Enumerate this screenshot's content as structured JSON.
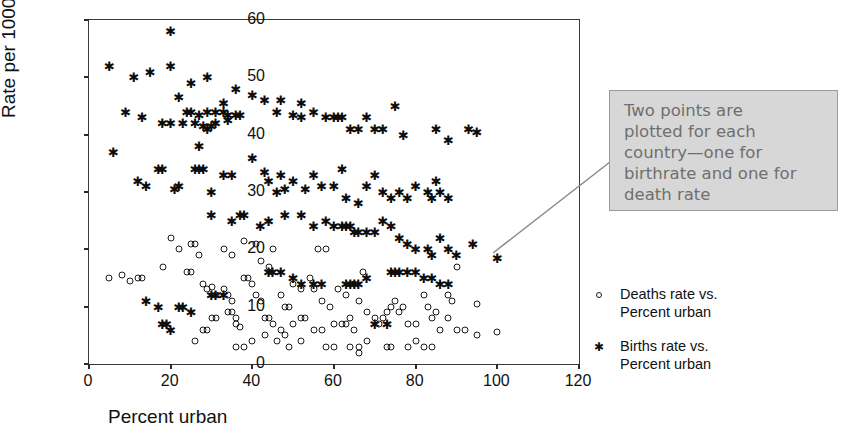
{
  "chart_data": {
    "type": "scatter",
    "title": "",
    "xlabel": "Percent urban",
    "ylabel": "Rate per 1000",
    "xlim": [
      0,
      120
    ],
    "ylim": [
      0,
      60
    ],
    "xticks": [
      0,
      20,
      40,
      60,
      80,
      100,
      120
    ],
    "yticks": [
      0,
      10,
      20,
      30,
      40,
      50,
      60
    ],
    "grid": false,
    "legend_position": "right",
    "annotation": "Two points are\nplotted for each\ncountry—one for\nbirthrate and one for\ndeath rate",
    "series": [
      {
        "name": "Births rate vs. Percent urban",
        "marker": "asterisk",
        "color": "#0d0d0d",
        "points": [
          [
            20,
            58
          ],
          [
            5,
            52
          ],
          [
            11,
            50
          ],
          [
            15,
            51
          ],
          [
            20,
            52
          ],
          [
            25,
            49
          ],
          [
            29,
            50
          ],
          [
            33,
            45.5
          ],
          [
            36,
            48
          ],
          [
            40,
            47
          ],
          [
            47,
            46
          ],
          [
            52,
            45.5
          ],
          [
            9,
            44
          ],
          [
            13,
            43
          ],
          [
            22,
            46.5
          ],
          [
            24,
            44
          ],
          [
            25,
            44
          ],
          [
            27,
            43.5
          ],
          [
            29,
            44
          ],
          [
            31,
            44
          ],
          [
            33,
            44
          ],
          [
            34,
            43.5
          ],
          [
            34,
            42.5
          ],
          [
            36,
            43.5
          ],
          [
            37,
            43.5
          ],
          [
            18,
            42
          ],
          [
            20,
            42
          ],
          [
            23,
            42
          ],
          [
            26,
            42
          ],
          [
            28,
            41.5
          ],
          [
            29,
            41
          ],
          [
            30,
            41.5
          ],
          [
            31,
            42
          ],
          [
            27,
            38
          ],
          [
            6,
            37
          ],
          [
            17,
            34
          ],
          [
            18,
            34
          ],
          [
            26,
            34
          ],
          [
            27,
            34
          ],
          [
            28,
            34
          ],
          [
            12,
            32
          ],
          [
            14,
            31
          ],
          [
            21,
            30.5
          ],
          [
            22,
            31
          ],
          [
            30,
            30
          ],
          [
            33,
            33
          ],
          [
            35,
            33
          ],
          [
            40,
            36
          ],
          [
            43,
            33.5
          ],
          [
            44,
            32
          ],
          [
            46,
            30
          ],
          [
            47,
            33
          ],
          [
            48,
            30.5
          ],
          [
            50,
            32
          ],
          [
            53,
            30.5
          ],
          [
            55,
            33
          ],
          [
            57,
            31
          ],
          [
            60,
            31
          ],
          [
            62,
            34
          ],
          [
            63,
            29
          ],
          [
            66,
            28
          ],
          [
            68,
            31
          ],
          [
            70,
            33
          ],
          [
            72,
            30
          ],
          [
            74,
            29
          ],
          [
            76,
            30
          ],
          [
            78,
            29
          ],
          [
            80,
            31
          ],
          [
            83,
            30
          ],
          [
            84,
            29
          ],
          [
            85,
            32
          ],
          [
            86,
            30
          ],
          [
            88,
            29
          ],
          [
            43,
            46
          ],
          [
            46,
            44
          ],
          [
            50,
            43.5
          ],
          [
            52,
            43
          ],
          [
            55,
            44
          ],
          [
            58,
            43
          ],
          [
            60,
            43
          ],
          [
            61,
            43
          ],
          [
            62,
            43
          ],
          [
            64,
            41
          ],
          [
            66,
            41
          ],
          [
            68,
            43
          ],
          [
            70,
            41
          ],
          [
            72,
            41
          ],
          [
            75,
            45
          ],
          [
            77,
            40
          ],
          [
            85,
            41
          ],
          [
            88,
            39
          ],
          [
            93,
            41
          ],
          [
            95,
            40.5
          ],
          [
            30,
            26
          ],
          [
            35,
            25
          ],
          [
            37,
            26
          ],
          [
            38,
            26
          ],
          [
            42,
            24
          ],
          [
            44,
            25
          ],
          [
            48,
            26
          ],
          [
            52,
            26
          ],
          [
            55,
            24
          ],
          [
            58,
            25
          ],
          [
            60,
            24
          ],
          [
            62,
            24
          ],
          [
            63,
            24
          ],
          [
            64,
            24
          ],
          [
            65,
            23
          ],
          [
            66,
            23
          ],
          [
            68,
            23
          ],
          [
            70,
            23
          ],
          [
            72,
            25
          ],
          [
            74,
            24
          ],
          [
            76,
            22
          ],
          [
            78,
            21
          ],
          [
            80,
            20
          ],
          [
            83,
            20
          ],
          [
            84,
            19
          ],
          [
            86,
            22
          ],
          [
            88,
            20
          ],
          [
            90,
            19
          ],
          [
            94,
            21
          ],
          [
            100,
            18.5
          ],
          [
            74,
            16
          ],
          [
            75,
            16
          ],
          [
            76,
            16
          ],
          [
            78,
            16
          ],
          [
            80,
            16
          ],
          [
            82,
            15
          ],
          [
            84,
            15
          ],
          [
            86,
            14
          ],
          [
            88,
            14
          ],
          [
            63,
            14
          ],
          [
            64,
            14
          ],
          [
            65,
            14
          ],
          [
            66,
            14
          ],
          [
            68,
            15
          ],
          [
            55,
            14
          ],
          [
            57,
            14
          ],
          [
            44,
            16
          ],
          [
            45,
            16
          ],
          [
            47,
            16
          ],
          [
            50,
            15
          ],
          [
            52,
            14
          ],
          [
            30,
            12
          ],
          [
            31,
            12
          ],
          [
            33,
            12
          ],
          [
            22,
            10
          ],
          [
            23,
            10
          ],
          [
            25,
            9
          ],
          [
            17,
            10
          ],
          [
            14,
            11
          ],
          [
            18,
            7
          ],
          [
            19,
            7
          ],
          [
            20,
            6
          ],
          [
            70,
            7
          ],
          [
            73,
            7
          ]
        ]
      },
      {
        "name": "Deaths rate vs. Percent urban",
        "marker": "circle",
        "color": "#1a1a1a",
        "points": [
          [
            5,
            15
          ],
          [
            8,
            15.5
          ],
          [
            10,
            14.5
          ],
          [
            12,
            15
          ],
          [
            13,
            15
          ],
          [
            18,
            17
          ],
          [
            20,
            22
          ],
          [
            22,
            20
          ],
          [
            24,
            16
          ],
          [
            25,
            16
          ],
          [
            25,
            21
          ],
          [
            26,
            21
          ],
          [
            27,
            19
          ],
          [
            28,
            14
          ],
          [
            29,
            13
          ],
          [
            30,
            13.5
          ],
          [
            31,
            12
          ],
          [
            30,
            8
          ],
          [
            31,
            8
          ],
          [
            33,
            13
          ],
          [
            34,
            12
          ],
          [
            35,
            11
          ],
          [
            34,
            9
          ],
          [
            35,
            9
          ],
          [
            36,
            8
          ],
          [
            36,
            7
          ],
          [
            37,
            6.5
          ],
          [
            33,
            20
          ],
          [
            35,
            19
          ],
          [
            38,
            15
          ],
          [
            39,
            15
          ],
          [
            40,
            14
          ],
          [
            41,
            12
          ],
          [
            42,
            11
          ],
          [
            43,
            8
          ],
          [
            44,
            8
          ],
          [
            45,
            7
          ],
          [
            38,
            21.5
          ],
          [
            41,
            21
          ],
          [
            42,
            18
          ],
          [
            44,
            17
          ],
          [
            45,
            20
          ],
          [
            47,
            12
          ],
          [
            48,
            10
          ],
          [
            49,
            10
          ],
          [
            47,
            6
          ],
          [
            50,
            7
          ],
          [
            52,
            8
          ],
          [
            53,
            8
          ],
          [
            50,
            14
          ],
          [
            52,
            13
          ],
          [
            54,
            15
          ],
          [
            55,
            13
          ],
          [
            56,
            20
          ],
          [
            58,
            20
          ],
          [
            57,
            11
          ],
          [
            59,
            10
          ],
          [
            60,
            7
          ],
          [
            62,
            7
          ],
          [
            63,
            7
          ],
          [
            64,
            8
          ],
          [
            65,
            6
          ],
          [
            61,
            13
          ],
          [
            63,
            12
          ],
          [
            65,
            14
          ],
          [
            66,
            11
          ],
          [
            67,
            16
          ],
          [
            68,
            9
          ],
          [
            70,
            8
          ],
          [
            71,
            7
          ],
          [
            72,
            8
          ],
          [
            73,
            9
          ],
          [
            74,
            10
          ],
          [
            75,
            11
          ],
          [
            76,
            9
          ],
          [
            77,
            10
          ],
          [
            78,
            7
          ],
          [
            80,
            7
          ],
          [
            82,
            12
          ],
          [
            83,
            10
          ],
          [
            84,
            8
          ],
          [
            85,
            9
          ],
          [
            86,
            6
          ],
          [
            88,
            8
          ],
          [
            90,
            17
          ],
          [
            95,
            10.5
          ],
          [
            95,
            5
          ],
          [
            100,
            5.5
          ],
          [
            88,
            12
          ],
          [
            89,
            11
          ],
          [
            90,
            6
          ],
          [
            92,
            6
          ],
          [
            55,
            6
          ],
          [
            57,
            6
          ],
          [
            43,
            5
          ],
          [
            46,
            4
          ],
          [
            48,
            5
          ],
          [
            28,
            6
          ],
          [
            29,
            6
          ],
          [
            26,
            4
          ],
          [
            36,
            3
          ],
          [
            38,
            3
          ],
          [
            40,
            4
          ],
          [
            49,
            3
          ],
          [
            52,
            4
          ],
          [
            64,
            3
          ],
          [
            66,
            3
          ],
          [
            58,
            3
          ],
          [
            60,
            3
          ],
          [
            68,
            4
          ],
          [
            78,
            3
          ],
          [
            80,
            4
          ],
          [
            82,
            3
          ],
          [
            84,
            3
          ],
          [
            73,
            3
          ],
          [
            74,
            3
          ],
          [
            66,
            2
          ]
        ]
      }
    ]
  },
  "axes": {
    "y_title": "Rate per 1000",
    "x_title": "Percent urban",
    "y_tick_labels": [
      "0",
      "10",
      "20",
      "30",
      "40",
      "50",
      "60"
    ],
    "x_tick_labels": [
      "0",
      "20",
      "40",
      "60",
      "80",
      "100",
      "120"
    ]
  },
  "annotation": {
    "text": "Two points are\nplotted for each\ncountry—one for\nbirthrate and one for\ndeath rate",
    "fill_color": "#d7d7d7",
    "text_color": "#6f6f6f"
  },
  "legend": {
    "entries": [
      {
        "marker": "circle",
        "label": "Deaths rate vs.\nPercent urban"
      },
      {
        "marker": "asterisk",
        "label": "Births rate vs.\nPercent urban"
      }
    ]
  }
}
